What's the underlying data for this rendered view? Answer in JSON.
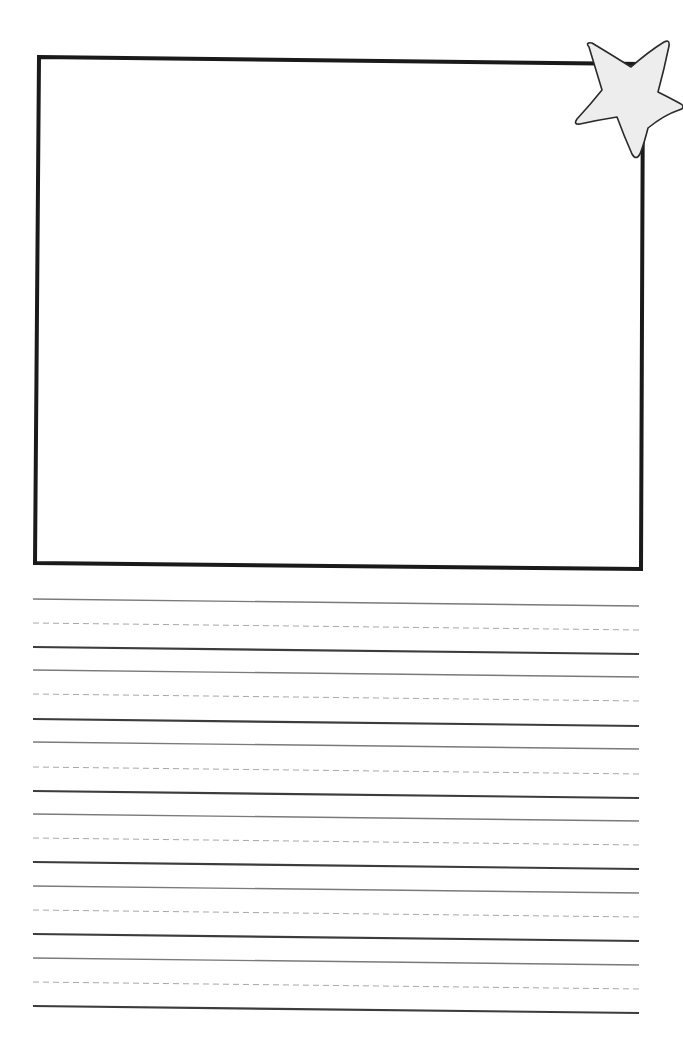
{
  "worksheet": {
    "type": "draw-and-write paper",
    "drawing_box": {
      "corners": {
        "top_left": [
          39,
          57
        ],
        "top_right": [
          643,
          64
        ],
        "bottom_right": [
          641,
          569
        ],
        "bottom_left": [
          35,
          563
        ]
      },
      "border_color": "#1a1a1a",
      "border_width": 4
    },
    "star_decoration": {
      "icon": "star-icon",
      "fill": "#ededed",
      "stroke": "#2a2a2a"
    },
    "handwriting_lines": {
      "line_count_groups": 6,
      "x_start": 33,
      "x_end": 639,
      "right_side_drop": 7,
      "groups": [
        {
          "top": 599,
          "mid": 623,
          "base": 647
        },
        {
          "top": 670,
          "mid": 694,
          "base": 719
        },
        {
          "top": 742,
          "mid": 767,
          "base": 791
        },
        {
          "top": 814,
          "mid": 838,
          "base": 862
        },
        {
          "top": 886,
          "mid": 910,
          "base": 934
        },
        {
          "top": 958,
          "mid": 982,
          "base": 1006
        }
      ],
      "colors": {
        "top_line": "#7a7a7a",
        "mid_dashed": "#a8a8a8",
        "base_line": "#3c3c3c"
      }
    }
  }
}
